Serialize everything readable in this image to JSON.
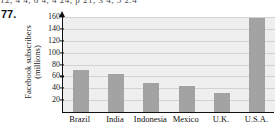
{
  "page": {
    "problem_number": "77.",
    "cropped_top_line": "12, 4      4, 6      4, 4      24, p      21, 3      4, 5      2.4"
  },
  "chart_data": {
    "type": "bar",
    "title": "",
    "xlabel": "",
    "ylabel": "Facebook subscribers (millions)",
    "ylabel_line1": "Facebook subscribers",
    "ylabel_line2": "(millions)",
    "categories": [
      "Brazil",
      "India",
      "Indonesia",
      "Mexico",
      "U.K.",
      "U.S.A."
    ],
    "values": [
      70,
      64,
      49,
      44,
      32,
      159
    ],
    "ylim": [
      0,
      160
    ],
    "yticks": [
      20,
      40,
      60,
      80,
      100,
      120,
      140,
      160
    ],
    "grid": true,
    "legend": "none",
    "bar_color": "#a3a3a3",
    "plot_background": "#efefef",
    "axis_color": "#111111"
  }
}
